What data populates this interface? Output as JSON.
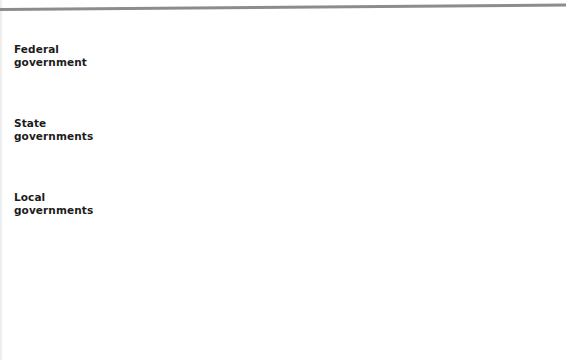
{
  "figure": {
    "type": "picket-fence-diagram",
    "title": "",
    "top_rule": true
  },
  "row_labels": [
    {
      "id": "federal",
      "line1": "Federal",
      "line2": "government",
      "text": "Federal government"
    },
    {
      "id": "state",
      "line1": "State",
      "line2": "governments",
      "text": "State governments"
    },
    {
      "id": "local",
      "line1": "Local",
      "line2": "governments",
      "text": "Local governments"
    }
  ],
  "categories": [
    "Agriculture",
    "Airports",
    "Elementary-secondary\neducation",
    "Environmental protection",
    "Roads and highways",
    "Mental health",
    "Public housing",
    "Public safety",
    "Urban renewal",
    "Vocational education",
    "Social welfare"
  ],
  "colors": {
    "federal_band": "#4a4a4a",
    "state_band": "#818181",
    "local_band": "#c6c6c6",
    "picket_fill": "#ffffff",
    "picket_stroke": "#6f6f6f",
    "rule": "#8c8c8c",
    "text": "#1c1c1c"
  },
  "chart_data": {
    "type": "table",
    "xlabel": "",
    "ylabel": "",
    "grid": false,
    "legend": "left row labels",
    "categories": [
      "Agriculture",
      "Airports",
      "Elementary-secondary education",
      "Environmental protection",
      "Roads and highways",
      "Mental health",
      "Public housing",
      "Public safety",
      "Urban renewal",
      "Vocational education",
      "Social welfare"
    ],
    "series": [
      {
        "name": "Federal government",
        "values": [
          1,
          1,
          1,
          1,
          1,
          1,
          1,
          1,
          1,
          1,
          1
        ],
        "color": "#4a4a4a"
      },
      {
        "name": "State governments",
        "values": [
          1,
          1,
          1,
          1,
          1,
          1,
          1,
          1,
          1,
          1,
          1
        ],
        "color": "#818181"
      },
      {
        "name": "Local governments",
        "values": [
          1,
          1,
          1,
          1,
          1,
          1,
          1,
          1,
          1,
          1,
          1
        ],
        "color": "#c6c6c6"
      }
    ]
  },
  "geometry": {
    "picket_count": 11,
    "picket_first_left": 100,
    "picket_pitch": 41,
    "picket_width": 22,
    "picket_top": 17,
    "picket_shoulder": 32,
    "picket_bottom": 228,
    "bands": [
      {
        "id": "federal",
        "top": 44,
        "height": 25
      },
      {
        "id": "state",
        "top": 118,
        "height": 21
      },
      {
        "id": "local",
        "top": 192,
        "height": 20
      }
    ]
  }
}
